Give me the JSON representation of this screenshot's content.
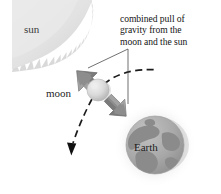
{
  "figure": {
    "kind": "astronomy-diagram",
    "background_color": "#ffffff"
  },
  "labels": {
    "sun": "sun",
    "moon": "moon",
    "earth": "Earth"
  },
  "caption": {
    "full_text": "combined pull of gravity from the moon and the sun",
    "lines": [
      "combined pull of",
      "gravity from the",
      "moon and the sun"
    ]
  },
  "bodies": {
    "sun": {
      "name": "sun",
      "position": "top-left",
      "shape": "corona-wedge-with-jagged-rays",
      "fill_color": "#e4e4e4",
      "ray_color": "#d2d2d2"
    },
    "moon": {
      "name": "moon",
      "position": "center-left",
      "shape": "sphere",
      "fill_color": "#dcdcdc",
      "shadow_color": "#b4b4b4",
      "center_x": 98,
      "center_y": 90,
      "radius": 11
    },
    "earth": {
      "name": "earth",
      "position": "bottom-right",
      "shape": "sphere-with-continents",
      "fill_color": "#a9a9a9",
      "continent_color": "#8d8d8d",
      "halo_color": "#ebebeb",
      "center_x": 155,
      "center_y": 145,
      "radius": 29
    }
  },
  "arrows": {
    "force_arrows": [
      {
        "name": "pull-toward-sun",
        "direction": "up-left",
        "color": "#8a8a8a",
        "edge_color": "#6e6e6e",
        "meaning": "gravitational pull component toward the sun"
      },
      {
        "name": "pull-toward-earth",
        "direction": "down-right",
        "color": "#8a8a8a",
        "edge_color": "#6e6e6e",
        "meaning": "gravitational pull component toward the earth"
      }
    ],
    "orbit_path": {
      "name": "moon-orbit-dashed-path",
      "style": "dashed",
      "color": "#1a1a1a",
      "has_arrowhead": true,
      "arrowhead_direction": "down"
    },
    "leader_lines": {
      "name": "caption-leader-lines",
      "color": "#555555",
      "count": 2
    }
  },
  "colors": {
    "ink": "#141414",
    "sun_fill": "#e4e4e4",
    "moon_fill": "#dcdcdc",
    "earth_fill": "#a9a9a9",
    "arrow_fill": "#8a8a8a",
    "background": "#ffffff"
  }
}
